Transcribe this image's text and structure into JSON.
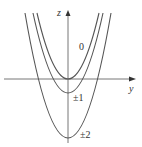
{
  "diagram": {
    "axes": {
      "vertical_label": "z",
      "horizontal_label": "y"
    },
    "curves": [
      {
        "label": "0",
        "vertex_offset": 0
      },
      {
        "label": "±1",
        "vertex_offset": 1
      },
      {
        "label": "±2",
        "vertex_offset": 4
      }
    ],
    "colors": {
      "curve": "#555555",
      "axis": "#666666",
      "text": "#333333"
    }
  }
}
